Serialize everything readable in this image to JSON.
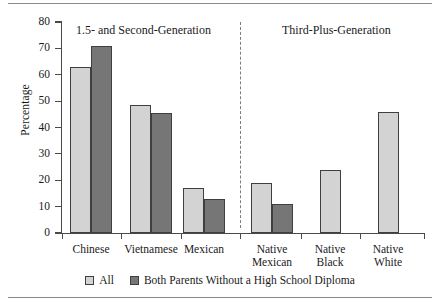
{
  "chart_data": {
    "type": "bar",
    "title": "",
    "xlabel": "",
    "ylabel": "Percentage",
    "ylim": [
      0,
      80
    ],
    "ytick_values": [
      0,
      10,
      20,
      30,
      40,
      50,
      60,
      70,
      80
    ],
    "ytick_labels": [
      "0",
      "10",
      "20",
      "30",
      "40",
      "50",
      "60",
      "70",
      "80"
    ],
    "grid": false,
    "legend_position": "bottom-center",
    "categories": [
      "Chinese",
      "Vietnamese",
      "Mexican",
      "Native\nMexican",
      "Native\nBlack",
      "Native\nWhite"
    ],
    "series": [
      {
        "name": "All",
        "color": "#d3d3d3",
        "values": [
          63,
          48.5,
          17,
          19,
          24,
          46
        ]
      },
      {
        "name": "Both Parents Without a High School Diploma",
        "color": "#767676",
        "values": [
          71,
          45.5,
          13,
          11,
          null,
          null
        ]
      }
    ],
    "panels": [
      {
        "label": "1.5- and Second-Generation",
        "categories": [
          "Chinese",
          "Vietnamese",
          "Mexican"
        ]
      },
      {
        "label": "Third-Plus-Generation",
        "categories": [
          "Native Mexican",
          "Native Black",
          "Native White"
        ]
      }
    ],
    "panel_divider": "dashed"
  },
  "legend": {
    "items": [
      {
        "label": "All",
        "swatch": "light"
      },
      {
        "label": "Both Parents Without a High School Diploma",
        "swatch": "dark"
      }
    ]
  },
  "axis": {
    "y_title": "Percentage",
    "y_labels": [
      "80",
      "70",
      "60",
      "50",
      "40",
      "30",
      "20",
      "10",
      "0"
    ]
  },
  "panel_titles": {
    "left": "1.5- and Second-Generation",
    "right": "Third-Plus-Generation"
  },
  "category_labels": [
    "Chinese",
    "Vietnamese",
    "Mexican",
    "Native\nMexican",
    "Native\nBlack",
    "Native\nWhite"
  ]
}
